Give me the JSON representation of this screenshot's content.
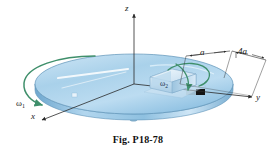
{
  "figure": {
    "caption": "Fig. P18-78",
    "background_color": "#ffffff",
    "axes": {
      "z_label": "z",
      "x_label": "x",
      "y_label": "y",
      "axis_color": "#2a2a2a"
    },
    "dimensions": [
      {
        "id": "a",
        "label": "a"
      },
      {
        "id": "4a",
        "label": "4a"
      }
    ],
    "angular_velocities": [
      {
        "id": "omega1",
        "symbol": "ω",
        "subscript": "1",
        "color": "#3f8f6b",
        "description": "disk spin about z axis"
      },
      {
        "id": "omega2",
        "symbol": "ω",
        "subscript": "2",
        "color": "#3f8f6b",
        "description": "block spin relative to disk"
      }
    ],
    "objects": {
      "disk": {
        "name": "turntable-disk",
        "top_color": "#b8d8ee",
        "edge_color": "#7fb4d8",
        "highlight_color": "#eaf5fc"
      },
      "shaft": {
        "name": "center-shaft",
        "color": "#8fb9d4"
      },
      "block": {
        "name": "block-on-disk",
        "color": "#cfe4f3"
      },
      "marker": {
        "name": "rim-marker",
        "color": "#1a1a1a"
      }
    }
  }
}
